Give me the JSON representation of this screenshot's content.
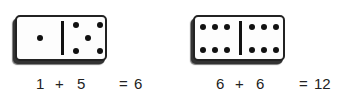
{
  "dominoes": [
    {
      "left_pips": 1,
      "right_pips": 5,
      "equation": {
        "a": "1",
        "op": "+",
        "b": "5",
        "eq": "=",
        "result": "6"
      }
    },
    {
      "left_pips": 6,
      "right_pips": 6,
      "equation": {
        "a": "6",
        "op": "+",
        "b": "6",
        "eq": "=",
        "result": "12"
      }
    }
  ],
  "colors": {
    "pip": "#111111",
    "face": "#fdfdfd",
    "text": "#222222"
  }
}
